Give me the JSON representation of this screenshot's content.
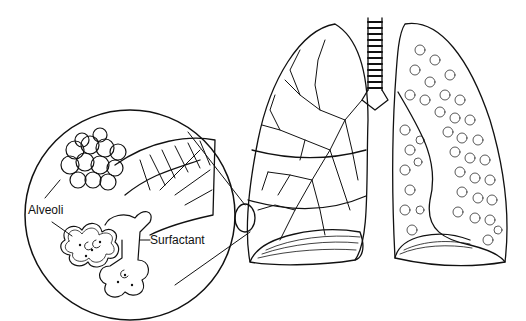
{
  "figure": {
    "labels": {
      "alveoli": "Alveoli",
      "surfactant": "Surfactant"
    },
    "colors": {
      "ink": "#111111",
      "background": "#ffffff"
    }
  }
}
